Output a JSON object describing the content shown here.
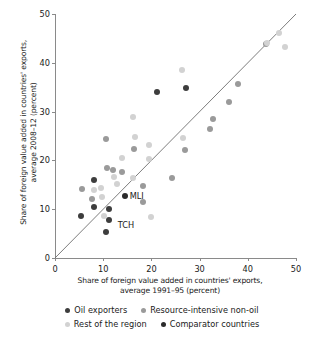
{
  "chart_data": {
    "type": "scatter",
    "title": "",
    "xlabel": "Share of foreign value added in countries' exports, average 1991–95 (percent)",
    "ylabel": "Share of foreign value added in countries' exports, average 2008–12 (percent)",
    "xlim": [
      0,
      50
    ],
    "ylim": [
      0,
      50
    ],
    "xticks": [
      0,
      10,
      20,
      30,
      40,
      50
    ],
    "yticks": [
      0,
      10,
      20,
      30,
      40,
      50
    ],
    "grid": false,
    "reference_line": {
      "label": "45-degree line",
      "from": [
        0,
        0
      ],
      "to": [
        50,
        50
      ]
    },
    "legend_position": "bottom",
    "series": [
      {
        "name": "Oil exporters",
        "color": "#3d3d3d",
        "points": [
          {
            "x": 5.4,
            "y": 8.7
          },
          {
            "x": 8.0,
            "y": 15.9
          },
          {
            "x": 8.0,
            "y": 10.4
          },
          {
            "x": 11.1,
            "y": 10.0
          },
          {
            "x": 11.3,
            "y": 7.8,
            "label": "TCH"
          },
          {
            "x": 10.6,
            "y": 5.4
          },
          {
            "x": 21.2,
            "y": 34.1
          },
          {
            "x": 27.1,
            "y": 34.8
          }
        ]
      },
      {
        "name": "Resource-intensive non-oil",
        "color": "#9a9a9a",
        "points": [
          {
            "x": 5.5,
            "y": 14.2
          },
          {
            "x": 7.6,
            "y": 12.1
          },
          {
            "x": 10.6,
            "y": 24.4
          },
          {
            "x": 10.8,
            "y": 18.5
          },
          {
            "x": 12.0,
            "y": 18.1
          },
          {
            "x": 14.0,
            "y": 17.7
          },
          {
            "x": 16.3,
            "y": 22.4
          },
          {
            "x": 18.3,
            "y": 14.8
          },
          {
            "x": 18.2,
            "y": 11.5
          },
          {
            "x": 24.2,
            "y": 16.3
          },
          {
            "x": 27.0,
            "y": 22.2
          },
          {
            "x": 32.1,
            "y": 26.4
          },
          {
            "x": 32.7,
            "y": 28.5
          },
          {
            "x": 36.1,
            "y": 31.9
          },
          {
            "x": 38.0,
            "y": 35.6
          },
          {
            "x": 43.8,
            "y": 43.9
          }
        ]
      },
      {
        "name": "Rest of the region",
        "color": "#d2d2d2",
        "points": [
          {
            "x": 8.1,
            "y": 14.0
          },
          {
            "x": 9.5,
            "y": 14.4
          },
          {
            "x": 9.7,
            "y": 12.4
          },
          {
            "x": 10.2,
            "y": 8.6
          },
          {
            "x": 12.3,
            "y": 16.6
          },
          {
            "x": 12.9,
            "y": 15.2
          },
          {
            "x": 14.0,
            "y": 20.4
          },
          {
            "x": 16.2,
            "y": 28.9
          },
          {
            "x": 16.5,
            "y": 24.7
          },
          {
            "x": 16.1,
            "y": 16.4
          },
          {
            "x": 19.6,
            "y": 23.2
          },
          {
            "x": 19.5,
            "y": 20.2
          },
          {
            "x": 20.0,
            "y": 8.4
          },
          {
            "x": 26.4,
            "y": 38.5
          },
          {
            "x": 26.6,
            "y": 24.5
          },
          {
            "x": 44.0,
            "y": 44.0
          },
          {
            "x": 46.5,
            "y": 46.2
          },
          {
            "x": 47.7,
            "y": 43.3
          }
        ]
      },
      {
        "name": "Comparator countries",
        "color": "#2b2b2b",
        "points": [
          {
            "x": 14.6,
            "y": 12.7,
            "label": "MLI"
          }
        ]
      }
    ],
    "annotations": [
      {
        "text": "MLI",
        "x": 15.5,
        "y": 12.8
      },
      {
        "text": "TCH",
        "x": 13.0,
        "y": 6.8
      }
    ]
  },
  "legend": {
    "items": [
      {
        "label": "Oil exporters",
        "color": "#3d3d3d"
      },
      {
        "label": "Resource-intensive non-oil",
        "color": "#9a9a9a"
      },
      {
        "label": "Rest of the region",
        "color": "#d2d2d2"
      },
      {
        "label": "Comparator countries",
        "color": "#2b2b2b"
      }
    ]
  },
  "axes": {
    "x_title": "Share of foreign value added in countries' exports, average 1991–95 (percent)",
    "y_title": "Share of foreign value added in countries' exports, average 2008–12 (percent)",
    "x_title_line1": "Share of foreign value added in countries' exports,",
    "x_title_line2": "average 1991–95 (percent)",
    "y_title_line1": "Share of foreign value added in countries' exports,",
    "y_title_line2": "average 2008–12 (percent)"
  }
}
